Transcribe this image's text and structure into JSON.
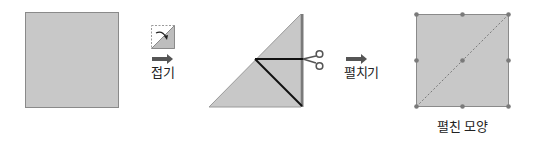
{
  "diagram": {
    "type": "paper-folding-cutting-sequence",
    "colors": {
      "paper_fill": "#c8c8c8",
      "paper_edge": "#8a8a8a",
      "cut_line": "#111111",
      "arrow": "#555555",
      "dot": "#7a7a7a",
      "dashed_line": "#7a7a7a",
      "scissors": "#555555"
    },
    "steps": [
      {
        "id": "original-square",
        "description": "Square sheet of paper"
      },
      {
        "id": "fold-step",
        "icon": "fold-diagonal-icon",
        "arrow": "right-arrow",
        "label": "접기"
      },
      {
        "id": "cut-step",
        "description": "Folded triangle with cut lines",
        "icon": "scissors-icon"
      },
      {
        "id": "unfold-step",
        "arrow": "right-arrow",
        "label": "펼치기"
      },
      {
        "id": "unfolded-result",
        "description": "Unfolded square with diagonal crease and dots",
        "label": "펼친 모양"
      }
    ],
    "labels": {
      "fold": "접기",
      "unfold": "펼치기",
      "result": "펼친 모양"
    }
  }
}
